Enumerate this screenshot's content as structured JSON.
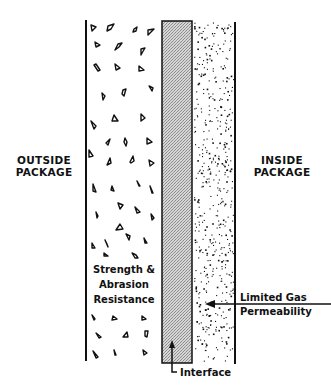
{
  "diagram": {
    "type": "cross-section",
    "colors": {
      "ink": "#111111",
      "interface_fill": "#c8c8c8",
      "background": "#ffffff"
    }
  },
  "labels": {
    "outside": [
      "OUTSIDE",
      "PACKAGE"
    ],
    "inside": [
      "INSIDE",
      "PACKAGE"
    ],
    "outer_layer": [
      "Strength &",
      "Abrasion",
      "Resistance"
    ],
    "inner_layer": [
      "Limited Gas",
      "Permeability"
    ],
    "interface": "Interface"
  },
  "layers": [
    {
      "name": "outer-layer",
      "pattern": "triangular-aggregate",
      "function": "Strength & Abrasion Resistance"
    },
    {
      "name": "interface-layer",
      "pattern": "gray-fill",
      "function": "Interface"
    },
    {
      "name": "inner-layer",
      "pattern": "stipple-dots",
      "function": "Limited Gas Permeability"
    }
  ]
}
